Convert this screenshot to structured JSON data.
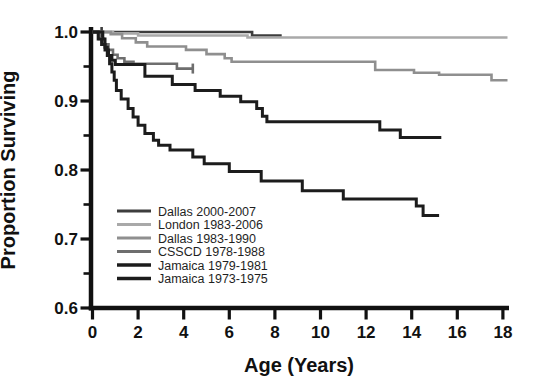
{
  "figure": {
    "background": "#ffffff",
    "axis_color": "#111111"
  },
  "chart_data": {
    "type": "line",
    "subtype": "kaplan-meier-step-survival",
    "title": "",
    "xlabel": "Age (Years)",
    "ylabel": "Proportion Surviving",
    "xlim": [
      0,
      18
    ],
    "ylim": [
      0.6,
      1.0
    ],
    "grid": false,
    "legend_position": "inside-lower-left",
    "x_ticks": [
      {
        "value": 0,
        "label": "0"
      },
      {
        "value": 2,
        "label": "2"
      },
      {
        "value": 4,
        "label": "4"
      },
      {
        "value": 6,
        "label": "6"
      },
      {
        "value": 8,
        "label": "8"
      },
      {
        "value": 10,
        "label": "10"
      },
      {
        "value": 12,
        "label": "12"
      },
      {
        "value": 14,
        "label": "14"
      },
      {
        "value": 16,
        "label": "16"
      },
      {
        "value": 18,
        "label": "18"
      }
    ],
    "y_ticks": [
      {
        "value": 1.0,
        "label": "1.0"
      },
      {
        "value": 0.9,
        "label": "0.9"
      },
      {
        "value": 0.8,
        "label": "0.8"
      },
      {
        "value": 0.7,
        "label": "0.7"
      },
      {
        "value": 0.6,
        "label": "0.6"
      }
    ],
    "y_minor_ticks": [
      0.95,
      0.85,
      0.75,
      0.65
    ],
    "series": [
      {
        "name": "Dallas 2000-2007",
        "color": "#3d3d3d",
        "width": 2.6,
        "steps": [
          [
            0,
            1.0
          ],
          [
            7.0,
            0.995
          ]
        ],
        "end": 8.3,
        "censor_ticks": [
          0.4
        ]
      },
      {
        "name": "London 1983-2006",
        "color": "#a9a9a9",
        "width": 2.6,
        "steps": [
          [
            0,
            1.0
          ],
          [
            0.9,
            0.998
          ],
          [
            2.0,
            0.995
          ],
          [
            6.8,
            0.992
          ]
        ],
        "end": 18.2,
        "censor_ticks": []
      },
      {
        "name": "Dallas 1983-1990",
        "color": "#8f8f8f",
        "width": 2.6,
        "steps": [
          [
            0,
            1.0
          ],
          [
            0.8,
            0.997
          ],
          [
            1.3,
            0.991
          ],
          [
            1.9,
            0.985
          ],
          [
            2.4,
            0.979
          ],
          [
            4.1,
            0.974
          ],
          [
            5.0,
            0.968
          ],
          [
            5.8,
            0.962
          ],
          [
            6.1,
            0.957
          ],
          [
            12.4,
            0.945
          ],
          [
            14.1,
            0.941
          ],
          [
            15.2,
            0.938
          ],
          [
            17.5,
            0.93
          ]
        ],
        "end": 18.2,
        "censor_ticks": []
      },
      {
        "name": "CSSCD 1978-1988",
        "color": "#6e6e6e",
        "width": 2.6,
        "steps": [
          [
            0,
            1.0
          ],
          [
            0.3,
            0.99
          ],
          [
            0.5,
            0.982
          ],
          [
            0.7,
            0.974
          ],
          [
            0.9,
            0.967
          ],
          [
            1.1,
            0.962
          ],
          [
            1.4,
            0.957
          ],
          [
            1.8,
            0.954
          ],
          [
            3.7,
            0.947
          ]
        ],
        "end": 4.4,
        "censor_ticks": [
          4.4
        ]
      },
      {
        "name": "Jamaica 1979-1981",
        "color": "#1c1c1c",
        "width": 3.0,
        "steps": [
          [
            0,
            1.0
          ],
          [
            0.25,
            0.99
          ],
          [
            0.4,
            0.982
          ],
          [
            0.55,
            0.974
          ],
          [
            0.7,
            0.966
          ],
          [
            0.85,
            0.959
          ],
          [
            1.0,
            0.953
          ],
          [
            2.3,
            0.936
          ],
          [
            3.5,
            0.924
          ],
          [
            4.5,
            0.915
          ],
          [
            5.6,
            0.907
          ],
          [
            6.5,
            0.899
          ],
          [
            7.2,
            0.889
          ],
          [
            7.45,
            0.878
          ],
          [
            7.65,
            0.87
          ],
          [
            12.6,
            0.858
          ],
          [
            13.5,
            0.847
          ]
        ],
        "end": 15.3,
        "censor_ticks": []
      },
      {
        "name": "Jamaica 1973-1975",
        "color": "#1c1c1c",
        "width": 3.0,
        "steps": [
          [
            0,
            1.0
          ],
          [
            0.45,
            0.99
          ],
          [
            0.55,
            0.978
          ],
          [
            0.65,
            0.966
          ],
          [
            0.75,
            0.954
          ],
          [
            0.85,
            0.942
          ],
          [
            0.95,
            0.93
          ],
          [
            1.05,
            0.915
          ],
          [
            1.26,
            0.903
          ],
          [
            1.56,
            0.889
          ],
          [
            1.78,
            0.877
          ],
          [
            2.0,
            0.865
          ],
          [
            2.3,
            0.853
          ],
          [
            2.67,
            0.843
          ],
          [
            2.9,
            0.836
          ],
          [
            3.4,
            0.829
          ],
          [
            4.4,
            0.819
          ],
          [
            4.9,
            0.809
          ],
          [
            6.0,
            0.798
          ],
          [
            7.4,
            0.784
          ],
          [
            9.2,
            0.77
          ],
          [
            11.0,
            0.758
          ],
          [
            14.2,
            0.748
          ],
          [
            14.5,
            0.734
          ]
        ],
        "end": 15.2,
        "censor_ticks": []
      }
    ]
  }
}
